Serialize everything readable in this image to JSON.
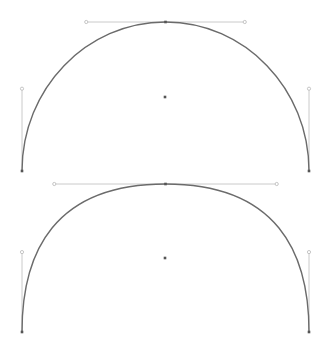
{
  "title": "",
  "colors": {
    "background": "#ffffff",
    "curve": "#6b6b6b",
    "handle_line": "#c4c4c4",
    "handle_knob": "#b8b8b8",
    "anchor": "#555555",
    "center": "#555555"
  },
  "diagrams": [
    {
      "name": "circular-arch",
      "description": "Semicircular arch drawn with two cubic Bezier segments",
      "top_handle_ratio": 0.5523,
      "side_handle_ratio": 0.5523
    },
    {
      "name": "squircle-arch",
      "description": "Squarer arch drawn with two cubic Bezier segments and longer tangent handles",
      "top_handle_ratio": 0.775,
      "side_handle_ratio": 0.54
    }
  ]
}
